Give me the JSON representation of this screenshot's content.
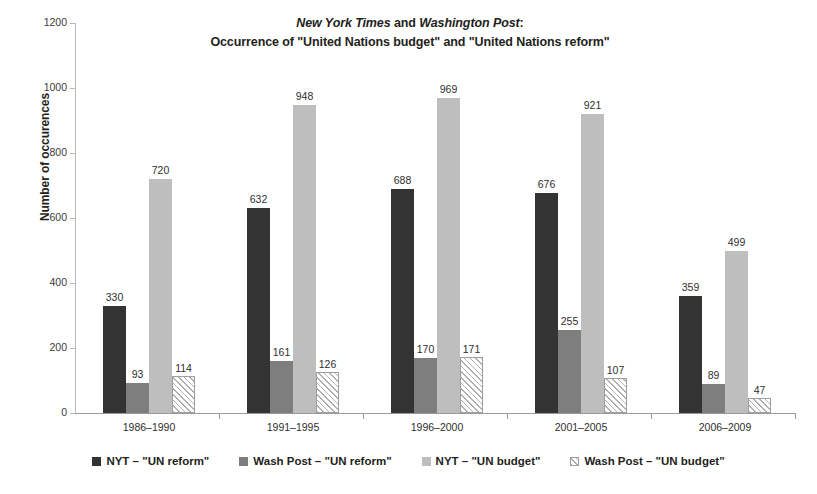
{
  "chart_data": {
    "type": "bar",
    "title": "New York Times and Washington Post: Occurrence of \"United Nations budget\" and \"United Nations reform\"",
    "title_line1_prefix": "New York Times",
    "title_line1_mid": " and ",
    "title_line1_italic2": "Washington Post",
    "title_line1_suffix": ":",
    "title_line2": "Occurrence of \"United Nations budget\" and \"United Nations reform\"",
    "xlabel": "",
    "ylabel": "Number of occurences",
    "ylim": [
      0,
      1200
    ],
    "ytick_step": 200,
    "yticks": [
      0,
      200,
      400,
      600,
      800,
      1000,
      1200
    ],
    "ytick_labels": [
      "0",
      "200",
      "400",
      "600",
      "800",
      "1000",
      "1200"
    ],
    "grid": false,
    "legend_position": "bottom",
    "categories": [
      "1986–1990",
      "1991–1995",
      "1996–2000",
      "2001–2005",
      "2006–2009"
    ],
    "series": [
      {
        "name": "NYT – \"UN reform\"",
        "color": "#333333",
        "pattern": "solid",
        "values": [
          330,
          632,
          688,
          676,
          359
        ]
      },
      {
        "name": "Wash Post – \"UN reform\"",
        "color": "#7e7e7e",
        "pattern": "solid",
        "values": [
          93,
          161,
          170,
          255,
          89
        ]
      },
      {
        "name": "NYT  – \"UN budget\"",
        "color": "#bebebe",
        "pattern": "solid",
        "values": [
          720,
          948,
          969,
          921,
          499
        ]
      },
      {
        "name": "Wash Post – \"UN budget\"",
        "color": "#ffffff",
        "pattern": "diagonal-hatch",
        "values": [
          114,
          126,
          171,
          107,
          47
        ]
      }
    ]
  }
}
